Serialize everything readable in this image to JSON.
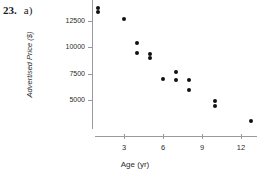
{
  "problem": {
    "number": "23.",
    "part": "a)"
  },
  "chart_data": {
    "type": "scatter",
    "title": "",
    "xlabel": "Age (yr)",
    "ylabel": "Advertised Price ($)",
    "xlim": [
      0,
      13.8
    ],
    "ylim": [
      2200,
      14200
    ],
    "grid": false,
    "legend": null,
    "xticks": [
      3,
      6,
      9,
      12
    ],
    "xtick_labels": [
      "3",
      "6",
      "9",
      "12"
    ],
    "yticks": [
      5000,
      7500,
      10000,
      12500
    ],
    "ytick_labels": [
      "5000",
      "7500",
      "10000",
      "12500"
    ],
    "marker": "filled-circle",
    "marker_color": "#111111",
    "axis_color": "#9a9a9a",
    "points": [
      {
        "x": 1.0,
        "y": 13700
      },
      {
        "x": 1.0,
        "y": 13350
      },
      {
        "x": 3.0,
        "y": 12700
      },
      {
        "x": 4.0,
        "y": 10400
      },
      {
        "x": 4.0,
        "y": 9450
      },
      {
        "x": 5.0,
        "y": 9400
      },
      {
        "x": 5.0,
        "y": 9000
      },
      {
        "x": 6.0,
        "y": 7000
      },
      {
        "x": 7.0,
        "y": 7700
      },
      {
        "x": 7.0,
        "y": 6950
      },
      {
        "x": 8.0,
        "y": 6950
      },
      {
        "x": 8.0,
        "y": 5950
      },
      {
        "x": 10.0,
        "y": 4900
      },
      {
        "x": 10.0,
        "y": 4450
      },
      {
        "x": 12.8,
        "y": 3000
      }
    ]
  }
}
